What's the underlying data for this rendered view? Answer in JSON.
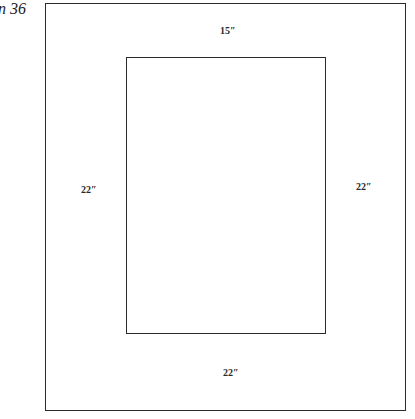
{
  "figure": {
    "caption": "n 36",
    "outer_rectangle": {
      "shape": "rectangle"
    },
    "inner_rectangle": {
      "shape": "rectangle"
    },
    "dimension_labels": {
      "top": "15″",
      "left": "22″",
      "right": "22″",
      "bottom": "22″"
    }
  }
}
